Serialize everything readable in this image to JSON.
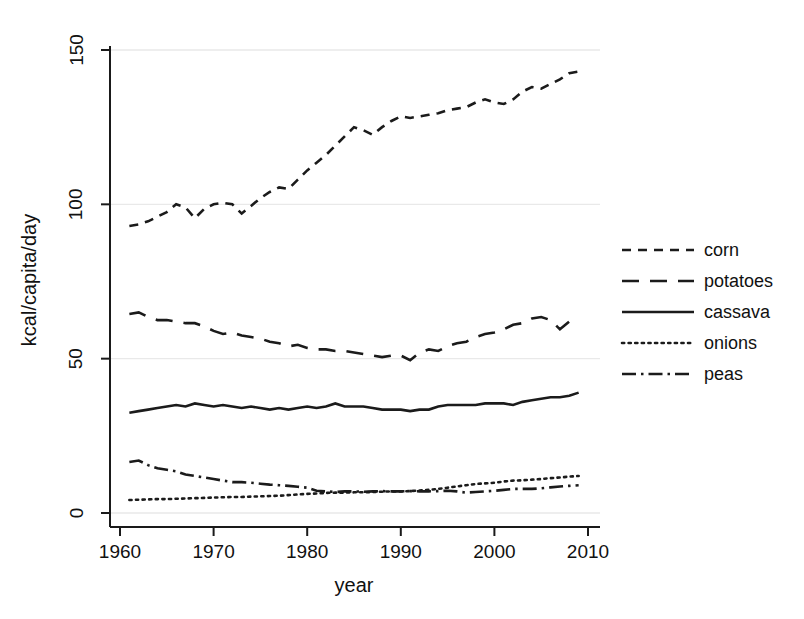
{
  "chart_data": {
    "type": "line",
    "title": "",
    "xlabel": "year",
    "ylabel": "kcal/capita/day",
    "xlim": [
      1958,
      2011
    ],
    "ylim": [
      0,
      155
    ],
    "xticks": [
      1960,
      1970,
      1980,
      1990,
      2000,
      2010
    ],
    "yticks": [
      0,
      50,
      100,
      150
    ],
    "xtick_labels": [
      "1960",
      "1970",
      "1980",
      "1990",
      "2000",
      "2010"
    ],
    "ytick_labels": [
      "0",
      "50",
      "100",
      "150"
    ],
    "grid": "horizontal-faint",
    "legend_position": "right",
    "x": [
      1961,
      1962,
      1963,
      1964,
      1965,
      1966,
      1967,
      1968,
      1969,
      1970,
      1971,
      1972,
      1973,
      1974,
      1975,
      1976,
      1977,
      1978,
      1979,
      1980,
      1981,
      1982,
      1983,
      1984,
      1985,
      1986,
      1987,
      1988,
      1989,
      1990,
      1991,
      1992,
      1993,
      1994,
      1995,
      1996,
      1997,
      1998,
      1999,
      2000,
      2001,
      2002,
      2003,
      2004,
      2005,
      2006,
      2007,
      2008,
      2009
    ],
    "series": [
      {
        "name": "corn",
        "style": "dashed",
        "values": [
          93,
          93.5,
          94.5,
          96,
          97.5,
          100,
          99,
          95.5,
          98.5,
          100,
          100.5,
          100,
          97,
          99.5,
          102,
          104,
          105.5,
          105,
          108,
          111,
          113.5,
          116,
          119,
          122,
          125,
          124,
          122.5,
          125,
          127,
          128.5,
          128,
          128.5,
          129,
          129.5,
          130.5,
          131,
          131.5,
          133,
          134,
          133,
          132.5,
          134,
          136.5,
          138,
          137.5,
          139,
          140.5,
          142.5,
          143
        ]
      },
      {
        "name": "potatoes",
        "style": "long-dashed",
        "values": [
          64.5,
          65,
          63.5,
          62.5,
          62.5,
          62,
          61.5,
          61.5,
          60.5,
          59,
          58,
          58.5,
          57.5,
          57,
          56.5,
          55.5,
          55,
          54,
          54.5,
          53.5,
          53,
          53,
          52.5,
          52.5,
          52,
          51.5,
          51,
          50.5,
          51,
          51,
          49.5,
          52,
          53,
          52.5,
          54,
          55,
          55.5,
          57,
          58,
          58.5,
          59.5,
          61,
          61.5,
          63,
          63.5,
          62.5,
          59.5,
          62,
          62.5
        ]
      },
      {
        "name": "cassava",
        "style": "solid",
        "values": [
          32.5,
          33,
          33.5,
          34,
          34.5,
          35,
          34.5,
          35.5,
          35,
          34.5,
          35,
          34.5,
          34,
          34.5,
          34,
          33.5,
          34,
          33.5,
          34,
          34.5,
          34,
          34.5,
          35.5,
          34.5,
          34.5,
          34.5,
          34,
          33.5,
          33.5,
          33.5,
          33,
          33.5,
          33.5,
          34.5,
          35,
          35,
          35,
          35,
          35.5,
          35.5,
          35.5,
          35,
          36,
          36.5,
          37,
          37.5,
          37.5,
          38,
          39
        ]
      },
      {
        "name": "onions",
        "style": "dotted",
        "values": [
          4.2,
          4.3,
          4.4,
          4.5,
          4.5,
          4.6,
          4.7,
          4.8,
          4.9,
          5.0,
          5.1,
          5.2,
          5.2,
          5.3,
          5.4,
          5.5,
          5.6,
          5.8,
          6.0,
          6.2,
          6.3,
          6.5,
          6.6,
          6.6,
          6.7,
          6.7,
          6.8,
          6.9,
          7.0,
          7.0,
          7.1,
          7.3,
          7.5,
          7.8,
          8.2,
          8.6,
          9.0,
          9.4,
          9.6,
          9.8,
          10.2,
          10.5,
          10.6,
          10.8,
          11.0,
          11.3,
          11.5,
          11.8,
          12.0
        ]
      },
      {
        "name": "peas",
        "style": "dash-dot",
        "values": [
          16.5,
          17,
          15.5,
          14.5,
          14,
          13.5,
          12.5,
          12,
          11.5,
          11,
          10.5,
          10,
          10,
          9.8,
          9.5,
          9.2,
          9.0,
          8.8,
          8.5,
          8.2,
          7.2,
          7.0,
          6.8,
          7.0,
          7.0,
          6.9,
          7.0,
          7.1,
          7.0,
          7.0,
          7.1,
          7.0,
          7.0,
          7.1,
          7.2,
          7.0,
          6.6,
          6.8,
          7.0,
          7.2,
          7.5,
          7.8,
          7.8,
          7.8,
          8.0,
          8.3,
          8.6,
          8.8,
          9.0
        ]
      }
    ]
  },
  "legend": {
    "items": [
      {
        "label": "corn"
      },
      {
        "label": "potatoes"
      },
      {
        "label": "cassava"
      },
      {
        "label": "onions"
      },
      {
        "label": "peas"
      }
    ]
  }
}
